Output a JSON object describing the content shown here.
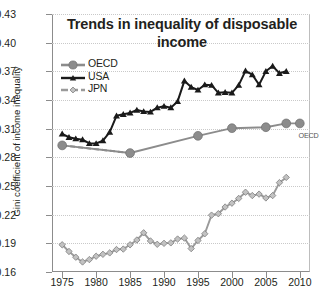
{
  "chart_data": {
    "type": "line",
    "title": "Trends in inequality of disposable income",
    "title_line1": "Trends in inequality of disposable",
    "title_line2": "income",
    "xlabel": "",
    "ylabel": "Gini coefficient of income inequality",
    "xlim": [
      1973.5,
      2011.5
    ],
    "ylim": [
      0.16,
      0.43
    ],
    "ytick_labels": [
      "0.43",
      "0.40",
      "0.37",
      "0.34",
      "0.31",
      "0.28",
      "0.25",
      "0.22",
      "0.19",
      "0.16"
    ],
    "ytick_values": [
      0.43,
      0.4,
      0.37,
      0.34,
      0.31,
      0.28,
      0.25,
      0.22,
      0.19,
      0.16
    ],
    "xtick_labels": [
      "1975",
      "1980",
      "1985",
      "1990",
      "1995",
      "2000",
      "2005",
      "2010"
    ],
    "xtick_values": [
      1975,
      1980,
      1985,
      1990,
      1995,
      2000,
      2005,
      2010
    ],
    "grid": true,
    "grid_axis": "y",
    "legend_position": "upper left",
    "annotations": [
      {
        "text": "OECD",
        "x": 2011.0,
        "y": 0.3125,
        "name": "oecd-edge-label"
      }
    ],
    "series": [
      {
        "name": "OECD",
        "color": "#8c8c8c",
        "marker": "circle",
        "linestyle": "solid",
        "x": [
          1975,
          1985,
          1995,
          2000,
          2005,
          2008,
          2010
        ],
        "y": [
          0.2925,
          0.2845,
          0.3025,
          0.3105,
          0.3115,
          0.3155,
          0.3155
        ]
      },
      {
        "name": "USA",
        "color": "#1a1a1a",
        "marker": "triangle",
        "linestyle": "solid",
        "x": [
          1975,
          1976,
          1977,
          1978,
          1979,
          1980,
          1981,
          1982,
          1983,
          1984,
          1985,
          1986,
          1987,
          1988,
          1989,
          1990,
          1991,
          1992,
          1993,
          1994,
          1995,
          1996,
          1997,
          1998,
          1999,
          2000,
          2001,
          2002,
          2003,
          2004,
          2005,
          2006,
          2007,
          2008
        ],
        "y": [
          0.3045,
          0.301,
          0.2995,
          0.2985,
          0.2945,
          0.2945,
          0.2975,
          0.3065,
          0.3235,
          0.325,
          0.3265,
          0.3295,
          0.328,
          0.3275,
          0.332,
          0.3335,
          0.332,
          0.3385,
          0.36,
          0.3535,
          0.3505,
          0.356,
          0.3555,
          0.3475,
          0.348,
          0.3475,
          0.3555,
          0.3705,
          0.3665,
          0.356,
          0.37,
          0.3755,
          0.368,
          0.37
        ]
      },
      {
        "name": "JPN",
        "color": "#9a9a9a",
        "marker": "diamond",
        "linestyle": "solid",
        "legend_linestyle": "dashed",
        "x": [
          1975,
          1976,
          1977,
          1978,
          1979,
          1980,
          1981,
          1982,
          1983,
          1984,
          1985,
          1986,
          1987,
          1988,
          1989,
          1990,
          1991,
          1992,
          1993,
          1994,
          1995,
          1996,
          1997,
          1998,
          1999,
          2000,
          2001,
          2002,
          2003,
          2004,
          2005,
          2006,
          2007,
          2008
        ],
        "y": [
          0.1885,
          0.1815,
          0.1755,
          0.1705,
          0.173,
          0.1765,
          0.1785,
          0.18,
          0.1835,
          0.184,
          0.1885,
          0.1935,
          0.201,
          0.1925,
          0.189,
          0.19,
          0.1905,
          0.1945,
          0.1955,
          0.1845,
          0.193,
          0.2,
          0.2195,
          0.221,
          0.228,
          0.232,
          0.237,
          0.2435,
          0.24,
          0.2415,
          0.2375,
          0.24,
          0.2535,
          0.259
        ]
      }
    ]
  }
}
